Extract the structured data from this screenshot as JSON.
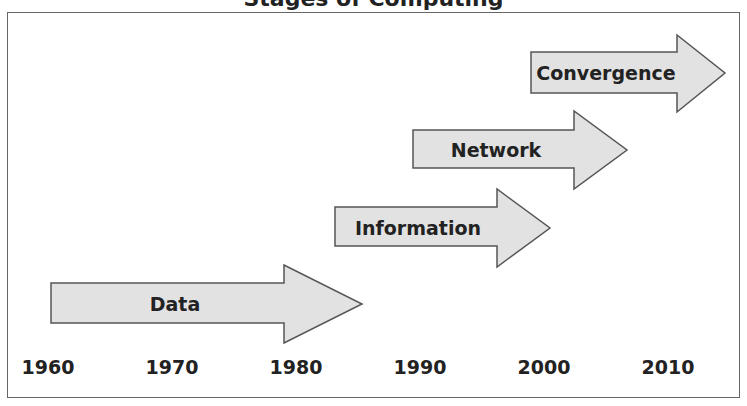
{
  "title": "Stages of Computing",
  "colors": {
    "arrow_fill": "#e2e2e2",
    "arrow_stroke": "#555555",
    "text": "#222222",
    "frame": "#666666"
  },
  "timeline": {
    "years": [
      "1960",
      "1970",
      "1980",
      "1990",
      "2000",
      "2010"
    ]
  },
  "stages": [
    {
      "label": "Data",
      "start": "1960",
      "end": "1985"
    },
    {
      "label": "Information",
      "start": "1983",
      "end": "2000"
    },
    {
      "label": "Network",
      "start": "1990",
      "end": "2006"
    },
    {
      "label": "Convergence",
      "start": "2000",
      "end": "2015"
    }
  ]
}
